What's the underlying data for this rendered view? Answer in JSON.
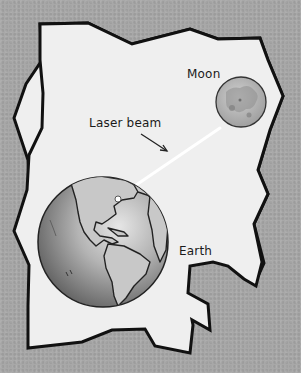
{
  "figure": {
    "labels": {
      "moon": "Moon",
      "laser_beam": "Laser beam",
      "earth": "Earth"
    },
    "icons": {
      "moon": "moon-icon",
      "earth": "earth-globe-icon",
      "laser_beam": "laser-beam-line",
      "arrow": "arrow-pointer-icon"
    },
    "colors": {
      "background": "#a8a8a8",
      "paper": "#efefef",
      "outline": "#111111",
      "beam": "#ffffff",
      "moon_fill": "#b5b5b5",
      "earth_fill": "#9a9a9a"
    }
  }
}
